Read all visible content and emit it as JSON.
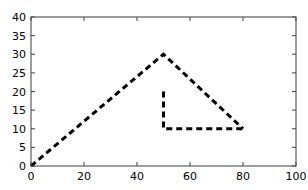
{
  "chart_data": {
    "type": "line",
    "title": "",
    "xlabel": "",
    "ylabel": "",
    "xlim": [
      0,
      100
    ],
    "ylim": [
      0,
      40
    ],
    "grid": false,
    "legend": null,
    "xticks": [
      0,
      20,
      40,
      60,
      80,
      100
    ],
    "yticks": [
      0,
      5,
      10,
      15,
      20,
      25,
      30,
      35,
      40
    ],
    "xtick_labels": [
      "0",
      "20",
      "40",
      "60",
      "80",
      "100"
    ],
    "ytick_labels": [
      "0",
      "5",
      "10",
      "15",
      "20",
      "25",
      "30",
      "35",
      "40"
    ],
    "line_style": "dashed",
    "line_color": "#000000",
    "line_width": 3,
    "series": [
      {
        "name": "outer-path",
        "x": [
          0,
          50,
          80
        ],
        "y": [
          0,
          30,
          10
        ]
      },
      {
        "name": "inner-path",
        "x": [
          50,
          50,
          80
        ],
        "y": [
          20,
          10,
          10
        ]
      }
    ]
  },
  "axes": {
    "spine_color": "#4d4d4d",
    "background_color": "#ffffff",
    "tick_direction": "in"
  }
}
